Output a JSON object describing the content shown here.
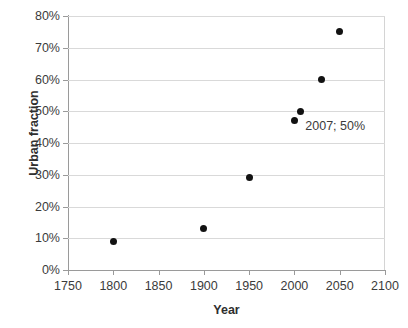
{
  "chart_data": {
    "type": "scatter",
    "title": "",
    "xlabel": "Year",
    "ylabel": "Urban fraction",
    "xlim": [
      1750,
      2100
    ],
    "ylim": [
      0,
      80
    ],
    "grid": "horizontal",
    "legend": "none",
    "xticks": [
      "1750",
      "1800",
      "1850",
      "1900",
      "1950",
      "2000",
      "2050",
      "2100"
    ],
    "xtick_values": [
      1750,
      1800,
      1850,
      1900,
      1950,
      2000,
      2050,
      2100
    ],
    "yticks": [
      "0%",
      "10%",
      "20%",
      "30%",
      "40%",
      "50%",
      "60%",
      "70%",
      "80%"
    ],
    "ytick_values": [
      0,
      10,
      20,
      30,
      40,
      50,
      60,
      70,
      80
    ],
    "series": [
      {
        "name": "Urban fraction",
        "marker": "filled-circle",
        "color": "#121212",
        "points": [
          {
            "x": 1800,
            "y": 9
          },
          {
            "x": 1900,
            "y": 13
          },
          {
            "x": 1950,
            "y": 29
          },
          {
            "x": 2000,
            "y": 47
          },
          {
            "x": 2007,
            "y": 50
          },
          {
            "x": 2030,
            "y": 60
          },
          {
            "x": 2050,
            "y": 75
          }
        ]
      }
    ],
    "annotations": [
      {
        "text": "2007; 50%",
        "x": 2012,
        "y": 45
      }
    ]
  },
  "colors": {
    "gridline": "#d9d9d9",
    "axis": "#9a9a9a",
    "marker": "#121212",
    "text": "#3b3b3b",
    "background": "#ffffff"
  }
}
